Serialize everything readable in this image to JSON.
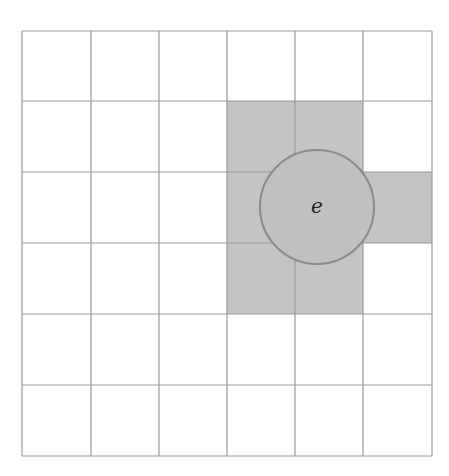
{
  "diagram": {
    "type": "grid-neighborhood",
    "grid": {
      "rows": 6,
      "cols": 6
    },
    "shaded_cells": [
      {
        "row": 1,
        "col": 3
      },
      {
        "row": 1,
        "col": 4
      },
      {
        "row": 2,
        "col": 3
      },
      {
        "row": 2,
        "col": 4
      },
      {
        "row": 2,
        "col": 5
      },
      {
        "row": 3,
        "col": 3
      },
      {
        "row": 3,
        "col": 4
      }
    ],
    "circle": {
      "label": "e"
    },
    "colors": {
      "grid_line": "#9a9a9a",
      "shaded": "#c4c4c4",
      "circle_fill": "#c0c0c0",
      "circle_stroke": "#8a8a8a"
    }
  }
}
